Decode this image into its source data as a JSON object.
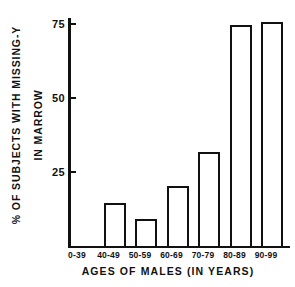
{
  "chart_data": {
    "type": "bar",
    "title": "",
    "xlabel": "AGES OF MALES (IN YEARS)",
    "ylabel": "% OF SUBJECTS WITH MISSING-Y IN MARROW",
    "ylabel_lines": [
      "% OF SUBJECTS WITH MISSING-Y",
      "IN MARROW"
    ],
    "categories": [
      "0-39",
      "40-49",
      "50-59",
      "60-69",
      "70-79",
      "80-89",
      "90-99"
    ],
    "values": [
      0,
      14.5,
      9,
      20,
      31.5,
      74.5,
      75.5
    ],
    "ylim": [
      0,
      77
    ],
    "yticks": [
      25,
      50,
      75
    ],
    "ytick_labels": [
      "25",
      "50",
      "75"
    ],
    "grid": false,
    "legend": null,
    "bar_style": "outlined",
    "bar_fill_color": "#ffffff",
    "bar_edge_color": "#111111",
    "axis_color": "#111111",
    "background_color": "#ffffff"
  }
}
